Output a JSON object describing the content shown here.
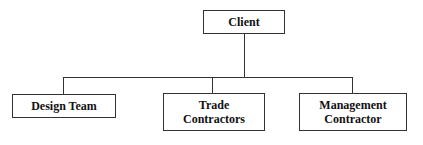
{
  "diagram": {
    "type": "org-chart",
    "root": {
      "label": "Client"
    },
    "children": [
      {
        "label": "Design Team"
      },
      {
        "label": "Trade Contractors",
        "lines": [
          "Trade",
          "Contractors"
        ]
      },
      {
        "label": "Management Contractor",
        "lines": [
          "Management",
          "Contractor"
        ]
      }
    ]
  }
}
